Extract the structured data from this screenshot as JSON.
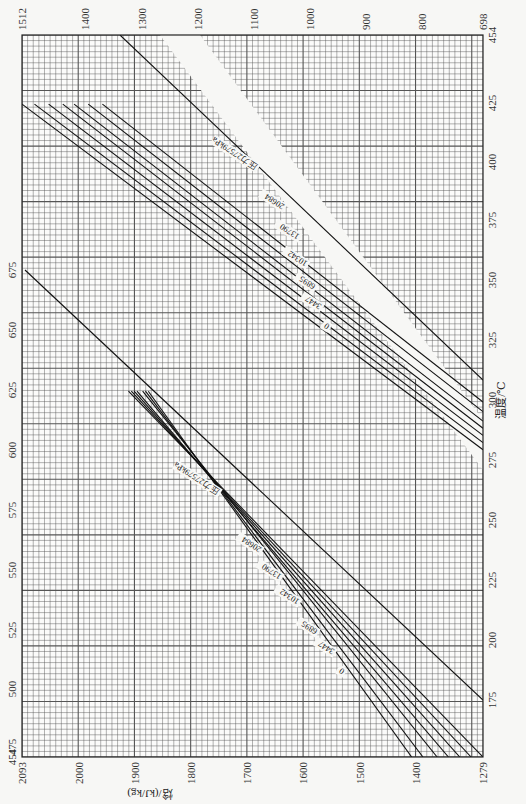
{
  "chart_data": {
    "type": "line",
    "title": "",
    "orientation": "rotated 90° clockwise (page printed sideways)",
    "xlabel": "温度/℃",
    "ylabel": "焓/(kJ/kg)",
    "panels": [
      {
        "name": "low-temperature panel (upper-right region)",
        "temperature_range": [
          175,
          454
        ],
        "enthalpy_range": [
          698,
          1512
        ],
        "temperature_ticks": [
          175,
          200,
          225,
          250,
          275,
          300,
          325,
          350,
          375,
          400,
          425,
          454
        ],
        "enthalpy_ticks": [
          1512,
          1400,
          1300,
          1200,
          1100,
          1000,
          900,
          800,
          698
        ],
        "legend_prefix": "压力",
        "unit": "kPa",
        "series": [
          {
            "name": "0",
            "points": [
              [
                280,
                698
              ],
              [
                425,
                1512
              ]
            ]
          },
          {
            "name": "3447",
            "points": [
              [
                283,
                698
              ],
              [
                425,
                1490
              ]
            ]
          },
          {
            "name": "6895",
            "points": [
              [
                286,
                698
              ],
              [
                425,
                1465
              ]
            ]
          },
          {
            "name": "10342",
            "points": [
              [
                289,
                698
              ],
              [
                425,
                1440
              ]
            ]
          },
          {
            "name": "13790",
            "points": [
              [
                292,
                698
              ],
              [
                425,
                1420
              ]
            ]
          },
          {
            "name": "20684",
            "points": [
              [
                296,
                698
              ],
              [
                425,
                1395
              ]
            ]
          },
          {
            "name": "27579",
            "points": [
              [
                300,
                698
              ],
              [
                425,
                1370
              ]
            ]
          }
        ]
      },
      {
        "name": "high-temperature panel (lower-left region)",
        "temperature_range": [
          454,
          675
        ],
        "enthalpy_range": [
          1279,
          2093
        ],
        "temperature_ticks": [
          454,
          475,
          500,
          525,
          550,
          575,
          600,
          625,
          650,
          675
        ],
        "enthalpy_ticks": [
          2093,
          2000,
          1900,
          1800,
          1700,
          1600,
          1500,
          1400,
          1279
        ],
        "legend_prefix": "压力",
        "unit": "kPa",
        "series": [
          {
            "name": "0",
            "points": [
              [
                454,
                1279
              ],
              [
                620,
                1905
              ]
            ]
          },
          {
            "name": "3447",
            "points": [
              [
                454,
                1300
              ],
              [
                620,
                1900
              ]
            ]
          },
          {
            "name": "6895",
            "points": [
              [
                454,
                1320
              ],
              [
                620,
                1895
              ]
            ]
          },
          {
            "name": "10342",
            "points": [
              [
                454,
                1340
              ],
              [
                620,
                1890
              ]
            ]
          },
          {
            "name": "13790",
            "points": [
              [
                454,
                1360
              ],
              [
                620,
                1880
              ]
            ]
          },
          {
            "name": "20684",
            "points": [
              [
                454,
                1385
              ],
              [
                620,
                1875
              ]
            ]
          },
          {
            "name": "27579",
            "points": [
              [
                454,
                1405
              ],
              [
                620,
                1870
              ]
            ]
          }
        ]
      }
    ],
    "grid": true,
    "legend_position": "inline labels along curves"
  },
  "labels": {
    "x_title": "温度/℃",
    "y_title": "焓/(kJ/kg)",
    "top_ticks": [
      "1512",
      "1400",
      "1300",
      "1200",
      "1100",
      "1000",
      "900",
      "800",
      "698"
    ],
    "bottom_ticks": [
      "2093",
      "2000",
      "1900",
      "1800",
      "1700",
      "1600",
      "1500",
      "1400",
      "1279"
    ],
    "left_ticks": [
      "675",
      "650",
      "625",
      "600",
      "575",
      "550",
      "525",
      "500",
      "475",
      "454"
    ],
    "right_ticks": [
      "454",
      "425",
      "400",
      "375",
      "350",
      "325",
      "300",
      "275",
      "250",
      "225",
      "200",
      "175"
    ],
    "upper_curve_labels": [
      "压力27579kPa",
      "20684",
      "13790",
      "10342",
      "6895",
      "3447",
      "0"
    ],
    "lower_curve_labels": [
      "压力27579kPa",
      "20684",
      "13790",
      "10342",
      "6895",
      "3447",
      "0"
    ]
  }
}
